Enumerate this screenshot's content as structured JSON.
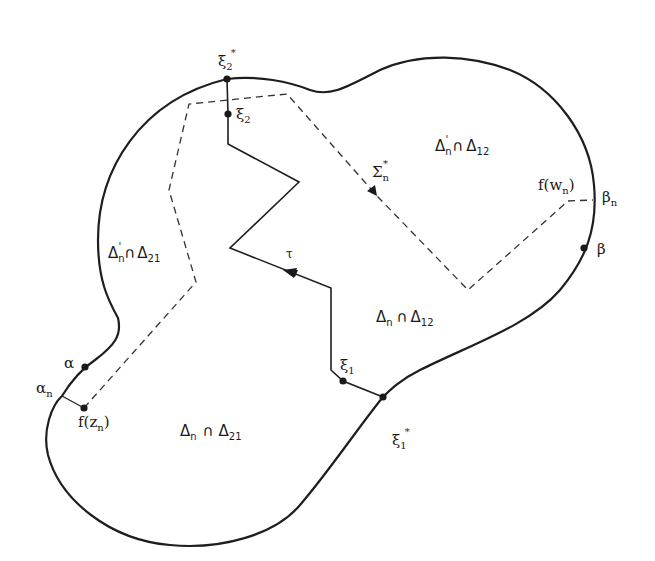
{
  "figure": {
    "type": "complex-analysis domain diagram",
    "points": {
      "xi2_star": {
        "base": "ξ",
        "sub": "2",
        "sup": "*"
      },
      "xi2": {
        "base": "ξ",
        "sub": "2"
      },
      "xi1": {
        "base": "ξ",
        "sub": "1"
      },
      "xi1_star": {
        "base": "ξ",
        "sub": "1",
        "sup": "*"
      },
      "alpha": {
        "base": "α"
      },
      "alpha_n": {
        "base": "α",
        "sub": "n"
      },
      "beta": {
        "base": "β"
      },
      "beta_n": {
        "base": "β",
        "sub": "n"
      },
      "f_zn": {
        "text": "f(z",
        "sub": "n",
        "close": ")"
      },
      "f_wn": {
        "text": "f(w",
        "sub": "n",
        "close": ")"
      }
    },
    "curves": {
      "tau": {
        "label": "τ"
      },
      "sigma": {
        "base": "Σ",
        "sub": "n",
        "sup": "*"
      }
    },
    "regions": [
      {
        "id": "dn_prime_d12",
        "base": "Δ",
        "sub": "n",
        "prime": "'",
        "op": "∩",
        "rhs": "Δ",
        "rhs_sub": "12"
      },
      {
        "id": "dn_prime_d21",
        "base": "Δ",
        "sub": "n",
        "prime": "'",
        "op": "∩",
        "rhs": "Δ",
        "rhs_sub": "21"
      },
      {
        "id": "dn_d12",
        "base": "Δ",
        "sub": "n",
        "prime": "",
        "op": "∩",
        "rhs": "Δ",
        "rhs_sub": "12"
      },
      {
        "id": "dn_d21",
        "base": "Δ",
        "sub": "n",
        "prime": "",
        "op": "∩",
        "rhs": "Δ",
        "rhs_sub": "21"
      }
    ]
  }
}
